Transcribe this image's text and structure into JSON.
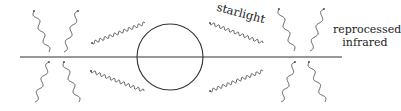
{
  "diagram": {
    "labels": {
      "starlight": "starlight",
      "reprocessed_line1": "reprocessed",
      "reprocessed_line2": "infrared"
    },
    "elements": {
      "star": {
        "shape": "circle",
        "cx": 170,
        "cy": 57,
        "r": 33
      },
      "disk": {
        "shape": "line",
        "x1": 20,
        "x2": 342,
        "y": 57
      },
      "starlight_rays": 4,
      "infrared_rays": 8
    },
    "colors": {
      "stroke": "#333333",
      "background": "#ffffff"
    }
  }
}
